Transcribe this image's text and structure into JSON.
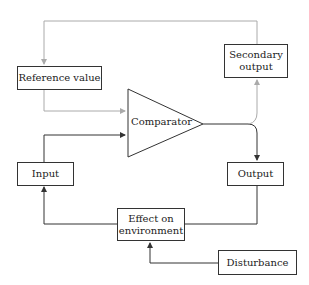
{
  "diagram": {
    "type": "feedback-control-loop",
    "nodes": {
      "reference_value": {
        "label": "Reference value"
      },
      "comparator": {
        "label": "Comparator"
      },
      "secondary_output": {
        "line1": "Secondary",
        "line2": "output"
      },
      "output": {
        "label": "Output"
      },
      "input": {
        "label": "Input"
      },
      "effect_on_environment": {
        "line1": "Effect on",
        "line2": "environment"
      },
      "disturbance": {
        "label": "Disturbance"
      }
    },
    "edges": [
      {
        "from": "secondary_output",
        "to": "reference_value",
        "style": "gray",
        "route": "top loop"
      },
      {
        "from": "reference_value",
        "to": "comparator",
        "style": "gray"
      },
      {
        "from": "input",
        "to": "comparator",
        "style": "black"
      },
      {
        "from": "comparator",
        "to": "output",
        "style": "black"
      },
      {
        "from": "comparator",
        "to": "secondary_output",
        "style": "gray"
      },
      {
        "from": "output",
        "to": "effect_on_environment",
        "style": "black"
      },
      {
        "from": "effect_on_environment",
        "to": "input",
        "style": "black"
      },
      {
        "from": "disturbance",
        "to": "effect_on_environment",
        "style": "black"
      }
    ],
    "colors": {
      "primary_line": "#333333",
      "secondary_line": "#aaaaaa",
      "box_border": "#333333",
      "text": "#222222"
    }
  }
}
